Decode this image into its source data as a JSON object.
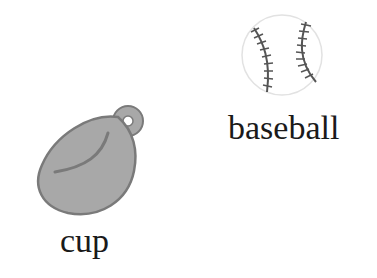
{
  "items": [
    {
      "label": "cup",
      "icon": "baseball-glove-icon",
      "fill": "#a8a8a8",
      "stroke": "#7a7a7a"
    },
    {
      "label": "baseball",
      "icon": "baseball-icon",
      "fill": "#ffffff",
      "stroke": "#555555"
    }
  ]
}
